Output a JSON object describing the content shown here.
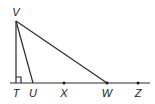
{
  "diagram": {
    "type": "geometry",
    "colors": {
      "stroke": "#2b2b2b",
      "text": "#1a1a1a",
      "background": "#ffffff"
    },
    "points": {
      "V": {
        "label": "V",
        "x": 16,
        "y": 21
      },
      "T": {
        "label": "T",
        "x": 16,
        "y": 83
      },
      "U": {
        "label": "U",
        "x": 33,
        "y": 83
      },
      "X": {
        "label": "X",
        "x": 64,
        "y": 83
      },
      "W": {
        "label": "W",
        "x": 107,
        "y": 83
      },
      "Z": {
        "label": "Z",
        "x": 138,
        "y": 83
      }
    },
    "segments": [
      "VT",
      "VU",
      "VW",
      "line through T, U, X, W, Z"
    ],
    "marks": {
      "right_angle_at": "T"
    }
  }
}
